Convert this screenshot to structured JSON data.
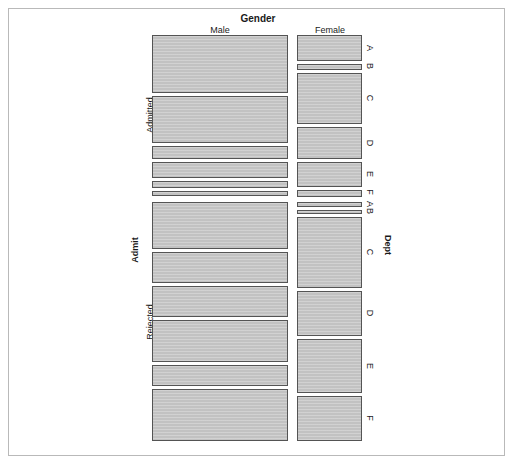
{
  "figure": {
    "kind": "mosaic-plot",
    "top_title": "Gender",
    "left_title": "Admit",
    "right_title": "Dept",
    "colors": {
      "tile_fill": "#c2c2c2",
      "tile_border": "#545454",
      "frame_border": "#b9b9b9",
      "background": "#ffffff",
      "text": "#1a1a1a"
    }
  },
  "axes": {
    "gender_levels": [
      {
        "label": "Male"
      },
      {
        "label": "Female"
      }
    ],
    "admit_levels": [
      {
        "label": "Admitted"
      },
      {
        "label": "Rejected"
      }
    ],
    "dept_levels": [
      {
        "label": "A"
      },
      {
        "label": "B"
      },
      {
        "label": "C"
      },
      {
        "label": "D"
      },
      {
        "label": "E"
      },
      {
        "label": "F"
      }
    ],
    "dept_labels_admitted": [
      "A",
      "B",
      "C",
      "D",
      "E",
      "F"
    ],
    "dept_labels_rejected": [
      "A",
      "B",
      "C",
      "D",
      "E",
      "F"
    ]
  },
  "chart_data": {
    "type": "mosaic",
    "title": "Gender",
    "xlabel": "Gender",
    "ylabel": "Admit",
    "y2label": "Dept",
    "grid": false,
    "legend": "none",
    "dimensions": [
      "Gender",
      "Admit",
      "Dept"
    ],
    "categories": {
      "Gender": [
        "Male",
        "Female"
      ],
      "Admit": [
        "Admitted",
        "Rejected"
      ],
      "Dept": [
        "A",
        "B",
        "C",
        "D",
        "E",
        "F"
      ]
    },
    "counts": [
      {
        "gender": "Male",
        "admit": "Admitted",
        "dept": "A",
        "value": 512
      },
      {
        "gender": "Male",
        "admit": "Admitted",
        "dept": "B",
        "value": 353
      },
      {
        "gender": "Male",
        "admit": "Admitted",
        "dept": "C",
        "value": 120
      },
      {
        "gender": "Male",
        "admit": "Admitted",
        "dept": "D",
        "value": 138
      },
      {
        "gender": "Male",
        "admit": "Admitted",
        "dept": "E",
        "value": 53
      },
      {
        "gender": "Male",
        "admit": "Admitted",
        "dept": "F",
        "value": 22
      },
      {
        "gender": "Male",
        "admit": "Rejected",
        "dept": "A",
        "value": 313
      },
      {
        "gender": "Male",
        "admit": "Rejected",
        "dept": "B",
        "value": 207
      },
      {
        "gender": "Male",
        "admit": "Rejected",
        "dept": "C",
        "value": 205
      },
      {
        "gender": "Male",
        "admit": "Rejected",
        "dept": "D",
        "value": 279
      },
      {
        "gender": "Male",
        "admit": "Rejected",
        "dept": "E",
        "value": 138
      },
      {
        "gender": "Male",
        "admit": "Rejected",
        "dept": "F",
        "value": 351
      },
      {
        "gender": "Female",
        "admit": "Admitted",
        "dept": "A",
        "value": 89
      },
      {
        "gender": "Female",
        "admit": "Admitted",
        "dept": "B",
        "value": 17
      },
      {
        "gender": "Female",
        "admit": "Admitted",
        "dept": "C",
        "value": 202
      },
      {
        "gender": "Female",
        "admit": "Admitted",
        "dept": "D",
        "value": 131
      },
      {
        "gender": "Female",
        "admit": "Admitted",
        "dept": "E",
        "value": 94
      },
      {
        "gender": "Female",
        "admit": "Admitted",
        "dept": "F",
        "value": 24
      },
      {
        "gender": "Female",
        "admit": "Rejected",
        "dept": "A",
        "value": 19
      },
      {
        "gender": "Female",
        "admit": "Rejected",
        "dept": "B",
        "value": 8
      },
      {
        "gender": "Female",
        "admit": "Rejected",
        "dept": "C",
        "value": 391
      },
      {
        "gender": "Female",
        "admit": "Rejected",
        "dept": "D",
        "value": 244
      },
      {
        "gender": "Female",
        "admit": "Rejected",
        "dept": "E",
        "value": 299
      },
      {
        "gender": "Female",
        "admit": "Rejected",
        "dept": "F",
        "value": 317
      }
    ]
  },
  "geometry": {
    "columns": [
      {
        "name": "Male",
        "x": 152,
        "w": 136
      },
      {
        "name": "Female",
        "x": 297,
        "w": 65
      }
    ],
    "male_admitted": [
      {
        "dept": "A",
        "y": 35,
        "h": 58
      },
      {
        "dept": "B",
        "y": 96,
        "h": 47
      },
      {
        "dept": "C",
        "y": 146,
        "h": 13
      },
      {
        "dept": "D",
        "y": 162,
        "h": 16
      },
      {
        "dept": "E",
        "y": 181,
        "h": 7
      },
      {
        "dept": "F",
        "y": 191,
        "h": 5
      }
    ],
    "male_rejected": [
      {
        "dept": "A",
        "y": 202,
        "h": 47
      },
      {
        "dept": "B",
        "y": 252,
        "h": 31
      },
      {
        "dept": "C",
        "y": 286,
        "h": 31
      },
      {
        "dept": "D",
        "y": 320,
        "h": 42
      },
      {
        "dept": "E",
        "y": 365,
        "h": 21
      },
      {
        "dept": "F",
        "y": 389,
        "h": 52
      }
    ],
    "female_admitted": [
      {
        "dept": "A",
        "y": 35,
        "h": 26
      },
      {
        "dept": "B",
        "y": 64,
        "h": 6
      },
      {
        "dept": "C",
        "y": 73,
        "h": 51
      },
      {
        "dept": "D",
        "y": 127,
        "h": 32
      },
      {
        "dept": "E",
        "y": 162,
        "h": 25
      },
      {
        "dept": "F",
        "y": 190,
        "h": 7
      }
    ],
    "female_rejected": [
      {
        "dept": "A",
        "y": 202,
        "h": 5
      },
      {
        "dept": "B",
        "y": 210,
        "h": 4
      },
      {
        "dept": "C",
        "y": 217,
        "h": 71
      },
      {
        "dept": "D",
        "y": 291,
        "h": 45
      },
      {
        "dept": "E",
        "y": 339,
        "h": 54
      },
      {
        "dept": "F",
        "y": 396,
        "h": 45
      }
    ]
  },
  "label_positions": {
    "gender_title_x": 258,
    "gender_title_y": 14,
    "male_x": 220,
    "female_x": 330,
    "col_label_y": 26,
    "admit_title_x": 131,
    "admit_title_y": 250,
    "admitted_x": 146,
    "admitted_y": 115,
    "rejected_x": 146,
    "rejected_y": 322,
    "dept_title_x": 392,
    "dept_title_y": 245,
    "dept_right_admitted": [
      {
        "label": "A",
        "y": 48
      },
      {
        "label": "B",
        "y": 66
      },
      {
        "label": "C",
        "y": 98
      },
      {
        "label": "D",
        "y": 143
      },
      {
        "label": "E",
        "y": 174
      },
      {
        "label": "F",
        "y": 192
      }
    ],
    "dept_right_rejected": [
      {
        "label": "A",
        "y": 204
      },
      {
        "label": "B",
        "y": 211
      },
      {
        "label": "C",
        "y": 252
      },
      {
        "label": "D",
        "y": 313
      },
      {
        "label": "E",
        "y": 366
      },
      {
        "label": "F",
        "y": 418
      }
    ],
    "dept_label_x": 374
  }
}
